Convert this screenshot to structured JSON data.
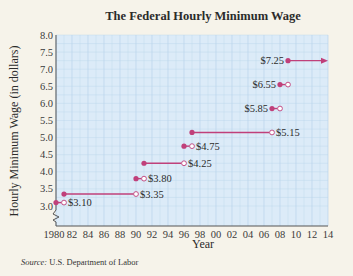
{
  "chart_data": {
    "type": "line",
    "subtype": "step",
    "title": "The Federal Hourly Minimum Wage",
    "xlabel": "Year",
    "ylabel": "Hourly Minimum Wage (in dollars)",
    "xlim": [
      1980,
      2014
    ],
    "ylim": [
      3.0,
      8.0
    ],
    "x_ticks": [
      1980,
      1982,
      1984,
      1986,
      1988,
      1990,
      1992,
      1994,
      1996,
      1998,
      2000,
      2002,
      2004,
      2006,
      2008,
      2010,
      2012,
      2014
    ],
    "x_tick_labels": [
      "1980",
      "82",
      "84",
      "86",
      "88",
      "90",
      "92",
      "94",
      "96",
      "98",
      "00",
      "02",
      "04",
      "06",
      "08",
      "10",
      "12",
      "14"
    ],
    "y_ticks": [
      3.0,
      3.5,
      4.0,
      4.5,
      5.0,
      5.5,
      6.0,
      6.5,
      7.0,
      7.5,
      8.0
    ],
    "y_tick_labels": [
      "3.0",
      "3.5",
      "4.0",
      "4.5",
      "5.0",
      "5.5",
      "6.0",
      "6.5",
      "7.0",
      "7.5",
      "8.0"
    ],
    "grid": true,
    "axis_break": true,
    "series": [
      {
        "name": "Minimum wage",
        "segments": [
          {
            "start": 1980,
            "end": 1981,
            "value": 3.1,
            "label": "$3.10",
            "start_closed": true,
            "end_closed": false
          },
          {
            "start": 1981,
            "end": 1990,
            "value": 3.35,
            "label": "$3.35",
            "start_closed": true,
            "end_closed": false
          },
          {
            "start": 1990,
            "end": 1991,
            "value": 3.8,
            "label": "$3.80",
            "start_closed": true,
            "end_closed": false
          },
          {
            "start": 1991,
            "end": 1996,
            "value": 4.25,
            "label": "$4.25",
            "start_closed": true,
            "end_closed": false
          },
          {
            "start": 1996,
            "end": 1997,
            "value": 4.75,
            "label": "$4.75",
            "start_closed": true,
            "end_closed": false
          },
          {
            "start": 1997,
            "end": 2007,
            "value": 5.15,
            "label": "$5.15",
            "start_closed": true,
            "end_closed": false
          },
          {
            "start": 2007,
            "end": 2008,
            "value": 5.85,
            "label": "$5.85",
            "start_closed": true,
            "end_closed": false,
            "label_side": "left"
          },
          {
            "start": 2008,
            "end": 2009,
            "value": 6.55,
            "label": "$6.55",
            "start_closed": true,
            "end_closed": false,
            "label_side": "left"
          },
          {
            "start": 2009,
            "end": 2014,
            "value": 7.25,
            "label": "$7.25",
            "start_closed": true,
            "arrow": true,
            "label_side": "left"
          }
        ]
      }
    ]
  },
  "colors": {
    "plot_bg": "#dcebf8",
    "grid": "#b9d3ec",
    "series": "#c0407a",
    "page_bg": "#f6f3ea"
  },
  "source": {
    "prefix": "Source:",
    "text": " U.S. Department of Labor"
  }
}
